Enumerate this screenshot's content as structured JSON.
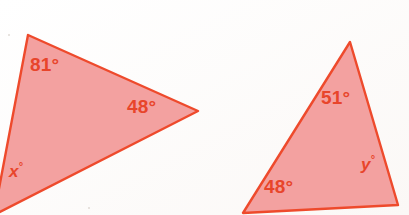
{
  "figure": {
    "background_color": "#fefdfc",
    "fill_color": "#f3a1a0",
    "stroke_color": "#ee4a2c",
    "label_color": "#e8452b"
  },
  "triangles": [
    {
      "id": "left-triangle",
      "name": "left-triangle",
      "points": "28,35 198,111 -6,215",
      "angles": [
        {
          "id": "left-angle-top",
          "text": "81°",
          "style": "numeric",
          "x": 30,
          "y": 55
        },
        {
          "id": "left-angle-right",
          "text": "48°",
          "style": "numeric",
          "x": 127,
          "y": 97
        },
        {
          "id": "left-angle-bottom",
          "text": "x°",
          "style": "variable",
          "x": 9,
          "y": 161,
          "var": "x"
        }
      ]
    },
    {
      "id": "right-triangle",
      "name": "right-triangle",
      "points": "350,42 398,205 243,213",
      "angles": [
        {
          "id": "right-angle-top",
          "text": "51°",
          "style": "numeric",
          "x": 321,
          "y": 88
        },
        {
          "id": "right-angle-bottom",
          "text": "48°",
          "style": "numeric",
          "x": 264,
          "y": 177
        },
        {
          "id": "right-angle-side",
          "text": "y°",
          "style": "variable",
          "x": 361,
          "y": 154,
          "var": "y"
        }
      ]
    }
  ],
  "labels": {
    "left_top": "81°",
    "left_right": "48°",
    "left_bottom": "x°",
    "left_bottom_var": "x",
    "left_bottom_deg": "°",
    "right_top": "51°",
    "right_bottom": "48°",
    "right_side": "y°",
    "right_side_var": "y",
    "right_side_deg": "°"
  }
}
